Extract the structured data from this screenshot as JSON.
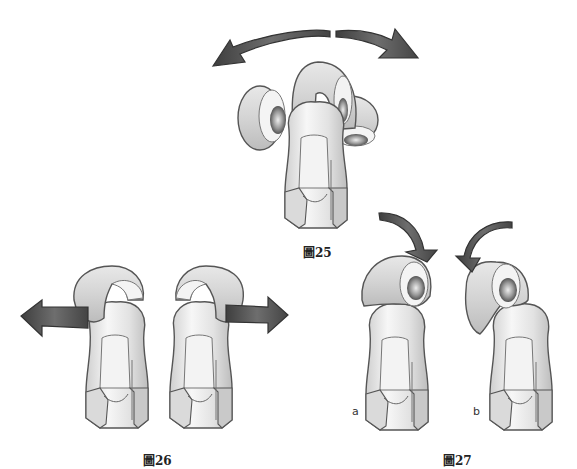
{
  "figures": [
    {
      "id": "fig25",
      "caption": "圖25",
      "description": "Bone segment with three cartilage discs; double-headed curved arrow indicating rotation left and right"
    },
    {
      "id": "fig26",
      "caption": "圖26",
      "description": "Two bone segments; cap displaced left (arrow left) and right (arrow right)"
    },
    {
      "id": "fig27",
      "caption": "圖27",
      "description": "Two bone segments with curved arrows indicating forward/backward tilt",
      "sublabels": [
        "a",
        "b"
      ]
    }
  ],
  "colors": {
    "outline": "#555555",
    "bone_fill": "#e4e4e4",
    "bone_light": "#f6f6f6",
    "bone_shadow": "#b8b8b8",
    "arrow_dark": "#4a4a4a",
    "arrow_mid": "#7a7a7a",
    "background": "#ffffff"
  }
}
